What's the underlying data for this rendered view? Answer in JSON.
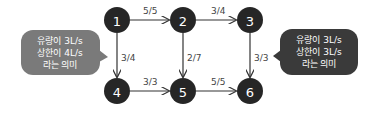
{
  "colors": {
    "node_fill": "#262626",
    "edge_stroke": "#333333",
    "bubble_left": "#7a7a7a",
    "bubble_right": "#3a3a3a",
    "text_light": "#ffffff",
    "label_text": "#444444"
  },
  "nodes": [
    {
      "id": "1",
      "label": "1",
      "x": 117,
      "y": 20
    },
    {
      "id": "2",
      "label": "2",
      "x": 183,
      "y": 20
    },
    {
      "id": "3",
      "label": "3",
      "x": 250,
      "y": 20
    },
    {
      "id": "4",
      "label": "4",
      "x": 117,
      "y": 91
    },
    {
      "id": "5",
      "label": "5",
      "x": 183,
      "y": 91
    },
    {
      "id": "6",
      "label": "6",
      "x": 250,
      "y": 91
    }
  ],
  "edges": [
    {
      "from": "1",
      "to": "2",
      "label": "5/5"
    },
    {
      "from": "2",
      "to": "3",
      "label": "3/4"
    },
    {
      "from": "1",
      "to": "4",
      "label": "3/4"
    },
    {
      "from": "2",
      "to": "5",
      "label": "2/7"
    },
    {
      "from": "3",
      "to": "6",
      "label": "3/3"
    },
    {
      "from": "4",
      "to": "5",
      "label": "3/3"
    },
    {
      "from": "5",
      "to": "6",
      "label": "5/5"
    }
  ],
  "callouts": {
    "left": {
      "lines": [
        "유량이 3L/s",
        "상한이 4L/s",
        "라는 의미"
      ],
      "points_to_edge": "1-4"
    },
    "right": {
      "lines": [
        "유량이 3L/s",
        "상한이 3L/s",
        "라는 의미"
      ],
      "points_to_edge": "3-6"
    }
  }
}
